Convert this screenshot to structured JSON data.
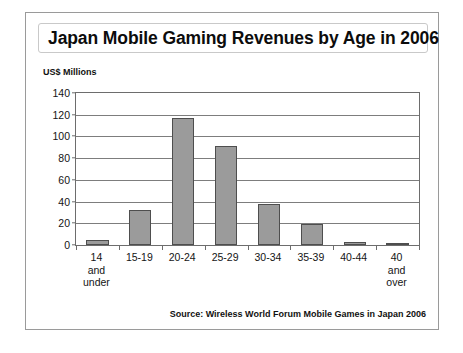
{
  "slide": {
    "title": "Japan Mobile Gaming Revenues by Age in 2006",
    "source_note": "Source: Wireless World Forum Mobile Games in Japan 2006"
  },
  "chart_data": {
    "type": "bar",
    "title": "Japan Mobile Gaming Revenues by Age in 2006",
    "subtitle": "",
    "xlabel": "",
    "ylabel": "US$ Millions",
    "categories": [
      "14 and under",
      "15-19",
      "20-24",
      "25-29",
      "30-34",
      "35-39",
      "40-44",
      "40 and over"
    ],
    "category_lines": [
      [
        "14",
        "and",
        "under"
      ],
      [
        "15-19"
      ],
      [
        "20-24"
      ],
      [
        "25-29"
      ],
      [
        "30-34"
      ],
      [
        "35-39"
      ],
      [
        "40-44"
      ],
      [
        "40",
        "and",
        "over"
      ]
    ],
    "values": [
      5,
      32,
      117,
      91,
      38,
      19,
      3,
      1
    ],
    "ylim": [
      0,
      140
    ],
    "ytick_values": [
      0,
      20,
      40,
      60,
      80,
      100,
      120,
      140
    ],
    "ytick_labels": [
      "0",
      "20",
      "40",
      "60",
      "80",
      "100",
      "120",
      "140"
    ],
    "grid": true,
    "legend": false,
    "bar_color": "#9b9b9b",
    "bar_border_color": "#4e4e4e",
    "axis_color": "#6d6d6d",
    "text_color": "#141414"
  }
}
